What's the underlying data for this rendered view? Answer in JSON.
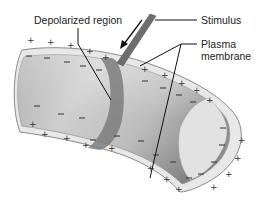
{
  "diagram": {
    "labels": {
      "depolarized_region": "Depolarized region",
      "stimulus": "Stimulus",
      "plasma_membrane_line1": "Plasma",
      "plasma_membrane_line2": "membrane"
    },
    "charges": {
      "outside": "+",
      "inside": "−"
    },
    "colors": {
      "membrane_fill": "#e6e6e6",
      "membrane_edge": "#8a8a8a",
      "cytoplasm_dark": "#9a9a9a",
      "cytoplasm_light": "#d9d9d9",
      "depolarized_band": "#7d7d7d",
      "electrode": "#6e6e6e",
      "leader_line": "#111111"
    }
  }
}
